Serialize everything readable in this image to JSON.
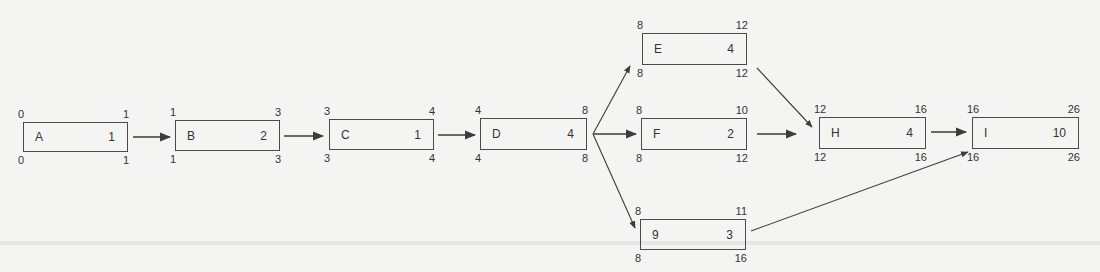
{
  "diagram": {
    "type": "activity-on-node network (critical path)",
    "nodes": [
      {
        "id": "A",
        "name": "A",
        "duration": "1",
        "es": "0",
        "ef": "1",
        "ls": "0",
        "lf": "1",
        "x": 23,
        "y": 122,
        "w": 105,
        "h": 30
      },
      {
        "id": "B",
        "name": "B",
        "duration": "2",
        "es": "1",
        "ef": "3",
        "ls": "1",
        "lf": "3",
        "x": 175,
        "y": 120,
        "w": 105,
        "h": 31
      },
      {
        "id": "C",
        "name": "C",
        "duration": "1",
        "es": "3",
        "ef": "4",
        "ls": "3",
        "lf": "4",
        "x": 329,
        "y": 119,
        "w": 105,
        "h": 31
      },
      {
        "id": "D",
        "name": "D",
        "duration": "4",
        "es": "4",
        "ef": "8",
        "ls": "4",
        "lf": "8",
        "x": 480,
        "y": 118,
        "w": 107,
        "h": 32
      },
      {
        "id": "E",
        "name": "E",
        "duration": "4",
        "es": "8",
        "ef": "12",
        "ls": "8",
        "lf": "12",
        "x": 642,
        "y": 33,
        "w": 105,
        "h": 32
      },
      {
        "id": "F",
        "name": "F",
        "duration": "2",
        "es": "8",
        "ef": "10",
        "ls": "8",
        "lf": "12",
        "x": 641,
        "y": 118,
        "w": 106,
        "h": 32
      },
      {
        "id": "G",
        "name": "9",
        "duration": "3",
        "es": "8",
        "ef": "11",
        "ls": "8",
        "lf": "16",
        "x": 640,
        "y": 219,
        "w": 106,
        "h": 31
      },
      {
        "id": "H",
        "name": "H",
        "duration": "4",
        "es": "12",
        "ef": "16",
        "ls": "12",
        "lf": "16",
        "x": 819,
        "y": 117,
        "w": 107,
        "h": 32
      },
      {
        "id": "I",
        "name": "I",
        "duration": "10",
        "es": "16",
        "ef": "26",
        "ls": "16",
        "lf": "26",
        "x": 972,
        "y": 117,
        "w": 107,
        "h": 32
      }
    ],
    "edges": [
      {
        "from": "A",
        "to": "B",
        "x1": 133,
        "y1": 137,
        "x2": 170,
        "y2": 137
      },
      {
        "from": "B",
        "to": "C",
        "x1": 284,
        "y1": 136,
        "x2": 323,
        "y2": 136
      },
      {
        "from": "C",
        "to": "D",
        "x1": 438,
        "y1": 135,
        "x2": 475,
        "y2": 135
      },
      {
        "from": "D",
        "to": "E",
        "x1": 593,
        "y1": 134,
        "x2": 630,
        "y2": 66
      },
      {
        "from": "D",
        "to": "F",
        "x1": 593,
        "y1": 134,
        "x2": 636,
        "y2": 134
      },
      {
        "from": "D",
        "to": "G",
        "x1": 593,
        "y1": 134,
        "x2": 635,
        "y2": 228
      },
      {
        "from": "E",
        "to": "H",
        "x1": 757,
        "y1": 68,
        "x2": 812,
        "y2": 127
      },
      {
        "from": "F",
        "to": "H",
        "x1": 757,
        "y1": 134,
        "x2": 796,
        "y2": 134
      },
      {
        "from": "H",
        "to": "I",
        "x1": 931,
        "y1": 132,
        "x2": 966,
        "y2": 132
      },
      {
        "from": "G",
        "to": "I",
        "x1": 751,
        "y1": 231,
        "x2": 968,
        "y2": 152
      }
    ],
    "colors": {
      "stroke": "#3c3c3c",
      "background": "#f4f4f3",
      "text": "#333333"
    }
  }
}
